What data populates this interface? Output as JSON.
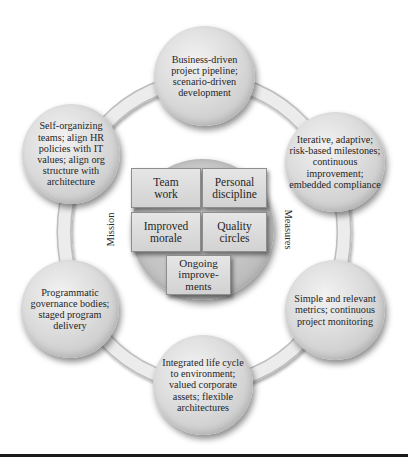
{
  "diagram": {
    "type": "cycle",
    "outer_nodes": [
      {
        "id": "top",
        "label": "Business-driven project pipeline; scenario-driven development"
      },
      {
        "id": "upper-right",
        "label": "Iterative, adaptive; risk-based milestones; continuous improvement; embedded compliance"
      },
      {
        "id": "lower-right",
        "label": "Simple and relevant metrics; continuous project monitoring"
      },
      {
        "id": "bottom",
        "label": "Integrated life cycle to environment; valued corporate assets; flexible architectures"
      },
      {
        "id": "lower-left",
        "label": "Programmatic governance bodies; staged program delivery"
      },
      {
        "id": "upper-left",
        "label": "Self-organizing teams; align HR policies with IT values; align org structure with architecture"
      }
    ],
    "side_labels": {
      "left": "Mission",
      "right": "Measures"
    },
    "center_boxes": [
      {
        "id": "team-work",
        "label": "Team work"
      },
      {
        "id": "personal-discipline",
        "label": "Personal discipline"
      },
      {
        "id": "improved-morale",
        "label": "Improved morale"
      },
      {
        "id": "quality-circles",
        "label": "Quality circles"
      },
      {
        "id": "ongoing-improvements",
        "label": "Ongoing improve-ments"
      }
    ],
    "colors": {
      "ring": "#e4e4e4",
      "node_fill": "#d6d6d6",
      "box_fill": "#dcdcdc",
      "text": "#262626",
      "rule": "#1a1a1a"
    }
  }
}
